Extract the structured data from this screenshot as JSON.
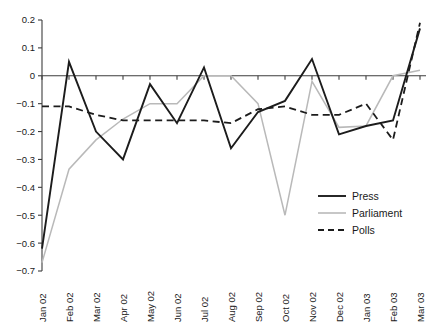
{
  "chart_data": {
    "type": "line",
    "title": "",
    "subtitle": "",
    "xlabel": "",
    "ylabel": "",
    "ylim": [
      -0.7,
      0.2
    ],
    "grid": false,
    "legend_position": "inside-bottom-right",
    "ytick_labels": [
      "0.2",
      "0.1",
      "0",
      "−0.1",
      "−0.2",
      "−0.3",
      "−0.4",
      "−0.5",
      "−0.6",
      "−0.7"
    ],
    "ytick_values": [
      0.2,
      0.1,
      0,
      -0.1,
      -0.2,
      -0.3,
      -0.4,
      -0.5,
      -0.6,
      -0.7
    ],
    "categories": [
      "Jan 02",
      "Feb 02",
      "Mar 02",
      "Apr 02",
      "May 02",
      "Jun 02",
      "Jul 02",
      "Aug 02",
      "Sep 02",
      "Oct 02",
      "Nov 02",
      "Dec 02",
      "Jan 03",
      "Feb 03",
      "Mar 03"
    ],
    "series": [
      {
        "name": "Press",
        "style": "solid",
        "color": "#1c1c1c",
        "values": [
          -0.62,
          0.05,
          -0.2,
          -0.3,
          -0.03,
          -0.17,
          0.03,
          -0.26,
          -0.13,
          -0.09,
          0.06,
          -0.21,
          -0.18,
          -0.16,
          0.17
        ]
      },
      {
        "name": "Parliament",
        "style": "solid",
        "color": "#b9b9b9",
        "values": [
          -0.67,
          -0.335,
          -0.23,
          -0.155,
          -0.1,
          -0.1,
          0.0,
          0.0,
          -0.1,
          -0.5,
          -0.02,
          -0.185,
          -0.18,
          0.0,
          0.02
        ]
      },
      {
        "name": "Polls",
        "style": "dashed",
        "color": "#1c1c1c",
        "values": [
          -0.11,
          -0.11,
          -0.14,
          -0.16,
          -0.16,
          -0.16,
          -0.16,
          -0.17,
          -0.12,
          -0.11,
          -0.14,
          -0.14,
          -0.1,
          -0.23,
          0.19
        ]
      }
    ]
  },
  "legend": {
    "items": [
      {
        "label": "Press"
      },
      {
        "label": "Parliament"
      },
      {
        "label": "Polls"
      }
    ]
  }
}
